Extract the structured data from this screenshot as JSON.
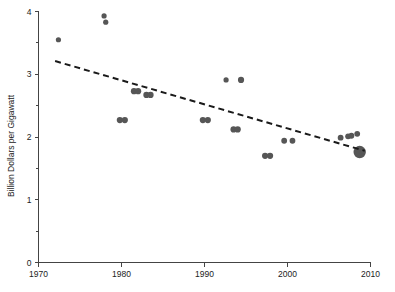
{
  "chart_data": {
    "type": "scatter",
    "title": "",
    "xlabel": "",
    "ylabel": "Billion Dollars per Gigawatt",
    "xlim": [
      1970,
      2010
    ],
    "ylim": [
      0,
      4
    ],
    "grid": false,
    "legend": null,
    "x_ticks": [
      "1970",
      "1980",
      "1990",
      "2000",
      "2010"
    ],
    "x_tick_values": [
      1970,
      1980,
      1990,
      2000,
      2010
    ],
    "y_ticks": [
      "0",
      "1",
      "2",
      "3",
      "4"
    ],
    "y_tick_values": [
      0,
      1,
      2,
      3,
      4
    ],
    "y_minor_tick_values": [
      0.5,
      1.5,
      2.5,
      3.5
    ],
    "point_color": "#565656",
    "trend_color": "#1a1a1a",
    "axis_color": "#444444",
    "points": [
      {
        "x": 1972.4,
        "y": 3.55,
        "r": 2.6
      },
      {
        "x": 1977.9,
        "y": 3.93,
        "r": 2.6
      },
      {
        "x": 1978.1,
        "y": 3.83,
        "r": 2.6
      },
      {
        "x": 1979.8,
        "y": 2.27,
        "r": 3.1
      },
      {
        "x": 1980.4,
        "y": 2.27,
        "r": 3.1
      },
      {
        "x": 1981.5,
        "y": 2.73,
        "r": 3.1
      },
      {
        "x": 1982.0,
        "y": 2.73,
        "r": 3.1
      },
      {
        "x": 1983.0,
        "y": 2.67,
        "r": 3.1
      },
      {
        "x": 1983.5,
        "y": 2.67,
        "r": 3.1
      },
      {
        "x": 1989.8,
        "y": 2.27,
        "r": 3.1
      },
      {
        "x": 1990.4,
        "y": 2.27,
        "r": 3.1
      },
      {
        "x": 1992.6,
        "y": 2.91,
        "r": 2.6
      },
      {
        "x": 1994.4,
        "y": 2.91,
        "r": 3.1
      },
      {
        "x": 1993.5,
        "y": 2.12,
        "r": 3.1
      },
      {
        "x": 1994.0,
        "y": 2.12,
        "r": 3.1
      },
      {
        "x": 1997.3,
        "y": 1.7,
        "r": 3.1
      },
      {
        "x": 1997.9,
        "y": 1.7,
        "r": 3.1
      },
      {
        "x": 1999.6,
        "y": 1.94,
        "r": 2.9
      },
      {
        "x": 2000.6,
        "y": 1.94,
        "r": 2.9
      },
      {
        "x": 2006.4,
        "y": 1.99,
        "r": 2.9
      },
      {
        "x": 2007.3,
        "y": 2.01,
        "r": 2.9
      },
      {
        "x": 2007.7,
        "y": 2.02,
        "r": 2.9
      },
      {
        "x": 2008.4,
        "y": 2.05,
        "r": 2.9
      },
      {
        "x": 2008.7,
        "y": 1.76,
        "r": 6.2
      }
    ],
    "trend": {
      "x_start": 1972.0,
      "y_start": 3.21,
      "x_end": 2009.3,
      "y_end": 1.78
    }
  }
}
